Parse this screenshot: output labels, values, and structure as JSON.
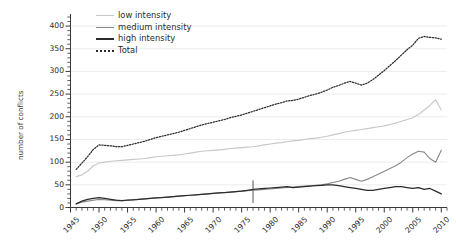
{
  "chart_data": {
    "type": "line",
    "title": "",
    "xlabel": "",
    "ylabel": "number of conflicts",
    "xlim": [
      1945,
      2011
    ],
    "ylim": [
      0,
      420
    ],
    "grid": true,
    "legend_position": "top-left",
    "x_tick_labels": [
      "1945",
      "1950",
      "1955",
      "1960",
      "1965",
      "1970",
      "1975",
      "1980",
      "1985",
      "1990",
      "1995",
      "2000",
      "2005",
      "2010"
    ],
    "y_tick_labels": [
      "0",
      "50",
      "100",
      "150",
      "200",
      "250",
      "300",
      "350",
      "400"
    ],
    "x": [
      1946,
      1947,
      1948,
      1949,
      1950,
      1951,
      1952,
      1953,
      1954,
      1955,
      1956,
      1957,
      1958,
      1959,
      1960,
      1961,
      1962,
      1963,
      1964,
      1965,
      1966,
      1967,
      1968,
      1969,
      1970,
      1971,
      1972,
      1973,
      1974,
      1975,
      1976,
      1977,
      1978,
      1979,
      1980,
      1981,
      1982,
      1983,
      1984,
      1985,
      1986,
      1987,
      1988,
      1989,
      1990,
      1991,
      1992,
      1993,
      1994,
      1995,
      1996,
      1997,
      1998,
      1999,
      2000,
      2001,
      2002,
      2003,
      2004,
      2005,
      2006,
      2007,
      2008,
      2009,
      2010
    ],
    "series": [
      {
        "name": "low intensity",
        "color": "#c8c8c8",
        "style": "solid",
        "values": [
          68,
          72,
          80,
          92,
          98,
          100,
          102,
          103,
          104,
          105,
          106,
          107,
          108,
          110,
          112,
          113,
          114,
          115,
          116,
          118,
          120,
          122,
          124,
          125,
          126,
          127,
          128,
          130,
          131,
          132,
          133,
          134,
          136,
          138,
          140,
          142,
          143,
          145,
          147,
          148,
          150,
          152,
          153,
          155,
          157,
          160,
          163,
          166,
          168,
          170,
          172,
          174,
          176,
          178,
          180,
          183,
          186,
          190,
          194,
          198,
          205,
          215,
          225,
          238,
          215
        ]
      },
      {
        "name": "medium intensity",
        "color": "#8a8a8a",
        "style": "solid",
        "values": [
          8,
          12,
          14,
          16,
          18,
          17,
          16,
          15,
          15,
          16,
          17,
          18,
          19,
          20,
          21,
          22,
          23,
          24,
          25,
          26,
          27,
          28,
          29,
          30,
          31,
          32,
          33,
          34,
          35,
          36,
          37,
          38,
          39,
          40,
          41,
          42,
          43,
          44,
          45,
          46,
          47,
          48,
          49,
          50,
          52,
          55,
          58,
          62,
          66,
          62,
          58,
          62,
          68,
          74,
          80,
          86,
          92,
          100,
          110,
          118,
          124,
          122,
          108,
          100,
          126
        ]
      },
      {
        "name": "high intensity",
        "color": "#2b2b2b",
        "style": "solid",
        "values": [
          8,
          14,
          18,
          20,
          22,
          20,
          18,
          16,
          15,
          16,
          17,
          18,
          19,
          20,
          21,
          22,
          23,
          24,
          25,
          26,
          27,
          28,
          29,
          30,
          31,
          32,
          33,
          34,
          35,
          36,
          38,
          40,
          41,
          42,
          43,
          44,
          45,
          46,
          44,
          45,
          46,
          47,
          48,
          49,
          50,
          50,
          48,
          46,
          44,
          42,
          40,
          38,
          38,
          40,
          42,
          44,
          46,
          46,
          44,
          42,
          44,
          40,
          42,
          36,
          30
        ]
      },
      {
        "name": "Total",
        "color": "#2b2b2b",
        "style": "dotted",
        "values": [
          84,
          98,
          112,
          128,
          138,
          137,
          136,
          134,
          134,
          137,
          140,
          143,
          146,
          150,
          154,
          157,
          160,
          163,
          166,
          170,
          174,
          178,
          182,
          185,
          188,
          191,
          194,
          198,
          201,
          204,
          208,
          212,
          216,
          220,
          224,
          228,
          231,
          235,
          236,
          239,
          243,
          247,
          250,
          254,
          259,
          265,
          269,
          274,
          278,
          274,
          270,
          274,
          282,
          292,
          302,
          313,
          324,
          336,
          348,
          358,
          373,
          377,
          375,
          374,
          371
        ]
      }
    ],
    "annotations": [
      {
        "type": "vertical-mark",
        "x": 1977,
        "y_from": 10,
        "y_to": 60
      }
    ]
  },
  "legend": {
    "items": [
      {
        "label": "low intensity"
      },
      {
        "label": "medium intensity"
      },
      {
        "label": "high intensity"
      },
      {
        "label": "Total"
      }
    ]
  }
}
